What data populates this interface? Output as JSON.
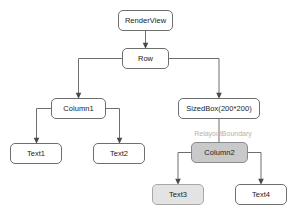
{
  "diagram": {
    "background_color": "#ffffff",
    "stroke_color": "#6e6e6e",
    "annotation_color": "#b2b2b2",
    "nodes": [
      {
        "id": "render-view",
        "label": "RenderView",
        "x": 118,
        "y": 10,
        "w": 55,
        "h": 21,
        "fill": "#ffffff",
        "style": "plain"
      },
      {
        "id": "row",
        "label": "Row",
        "x": 122,
        "y": 48,
        "w": 47,
        "h": 21,
        "fill": "#ffffff",
        "style": "plain"
      },
      {
        "id": "column1",
        "label": "Column1",
        "x": 51,
        "y": 98,
        "w": 55,
        "h": 21,
        "fill": "#ffffff",
        "style": "plain"
      },
      {
        "id": "sized-box",
        "label": "SizedBox(200*200)",
        "x": 178,
        "y": 98,
        "w": 82,
        "h": 21,
        "fill": "#ffffff",
        "style": "plain"
      },
      {
        "id": "text1",
        "label": "Text1",
        "x": 10,
        "y": 143,
        "w": 52,
        "h": 21,
        "fill": "#ffffff",
        "style": "plain"
      },
      {
        "id": "text2",
        "label": "Text2",
        "x": 93,
        "y": 143,
        "w": 52,
        "h": 21,
        "fill": "#ffffff",
        "style": "plain"
      },
      {
        "id": "column2",
        "label": "Column2",
        "x": 191,
        "y": 142,
        "w": 57,
        "h": 21,
        "fill": "#c9c9c9",
        "style": "filled-mid"
      },
      {
        "id": "text3",
        "label": "Text3",
        "x": 152,
        "y": 184,
        "w": 52,
        "h": 21,
        "fill": "#e3e3e3",
        "style": "filled-light"
      },
      {
        "id": "text4",
        "label": "Text4",
        "x": 235,
        "y": 184,
        "w": 52,
        "h": 21,
        "fill": "#ffffff",
        "style": "plain"
      }
    ],
    "annotations": [
      {
        "id": "relayout-boundary-label",
        "text": "RelayoutBoundary",
        "x": 223,
        "y": 130,
        "color": "#b2b2b2"
      }
    ],
    "edges": [
      {
        "id": "edge-renderview-row",
        "from": "render-view",
        "to": "row",
        "path": "M145.5,31 L145.5,45.5",
        "arrow": true
      },
      {
        "id": "edge-row-column1",
        "from": "row",
        "to": "column1",
        "path": "M122,58.5 L78.5,58.5 L78.5,95.5",
        "arrow": true
      },
      {
        "id": "edge-row-sizedbox",
        "from": "row",
        "to": "sized-box",
        "path": "M169,58.5 L219,58.5 L219,95.5",
        "arrow": true
      },
      {
        "id": "edge-column1-text1",
        "from": "column1",
        "to": "text1",
        "path": "M51,108.5 L36.5,108.5 L36.5,140.5",
        "arrow": true
      },
      {
        "id": "edge-column1-text2",
        "from": "column1",
        "to": "text2",
        "path": "M106,108.5 L119.5,108.5 L119.5,140.5",
        "arrow": true
      },
      {
        "id": "edge-sizedbox-column2",
        "from": "sized-box",
        "to": "column2",
        "path": "M219,119 L219,142",
        "arrow": false
      },
      {
        "id": "edge-column2-text3",
        "from": "column2",
        "to": "text3",
        "path": "M191,152.5 L178,152.5 L178,181.5",
        "arrow": true
      },
      {
        "id": "edge-column2-text4",
        "from": "column2",
        "to": "text4",
        "path": "M248,152.5 L261,152.5 L261,181.5",
        "arrow": true
      }
    ]
  }
}
